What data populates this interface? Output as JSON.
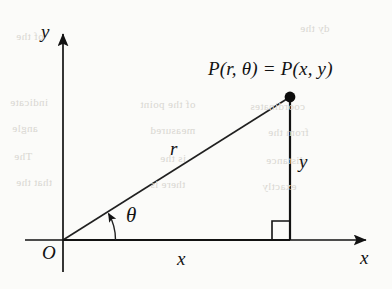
{
  "figure": {
    "background_color": "#fbfbf9",
    "ink_color": "#121212",
    "width": 392,
    "height": 289
  },
  "labels": {
    "point_p": "P(r, θ) = P(x, y)",
    "radius": "r",
    "angle": "θ",
    "vertical_leg": "y",
    "horizontal_leg": "x",
    "axis_y": "y",
    "axis_x": "x",
    "origin": "O"
  },
  "chart_data": {
    "type": "diagram",
    "subtitle": "",
    "xlabel": "x",
    "ylabel": "y",
    "grid": false,
    "legend": "none",
    "annotations": [
      "P(r, θ) = P(x, y)",
      "r",
      "θ",
      "y",
      "x",
      "O"
    ],
    "points": [
      {
        "name": "O",
        "label": "O",
        "px": [
          63,
          240
        ]
      },
      {
        "name": "P",
        "label": "P(r, θ) = P(x, y)",
        "px": [
          290,
          97
        ]
      },
      {
        "name": "foot",
        "label": "",
        "px": [
          290,
          240
        ]
      }
    ],
    "segments": [
      {
        "name": "radius",
        "label": "r",
        "from": [
          63,
          240
        ],
        "to": [
          290,
          97
        ]
      },
      {
        "name": "vertical-leg",
        "label": "y",
        "from": [
          290,
          240
        ],
        "to": [
          290,
          97
        ]
      },
      {
        "name": "horizontal-leg",
        "label": "x",
        "from": [
          63,
          240
        ],
        "to": [
          290,
          240
        ]
      }
    ],
    "axes": [
      {
        "name": "x-axis",
        "from": [
          25,
          240
        ],
        "to": [
          372,
          240
        ],
        "arrow": "end"
      },
      {
        "name": "y-axis",
        "from": [
          63,
          272
        ],
        "to": [
          63,
          28
        ],
        "arrow": "end"
      }
    ],
    "markers": [
      {
        "name": "right-angle",
        "type": "square",
        "at": [
          290,
          240
        ],
        "size": 18
      },
      {
        "name": "angle-arc",
        "type": "arc",
        "at": [
          63,
          240
        ],
        "radius": 52,
        "from_deg": 0,
        "to_deg": 32,
        "arrow": "end"
      }
    ]
  },
  "bleed_text": [
    {
      "text": "of the",
      "left": 16,
      "top": 30
    },
    {
      "text": "dy the",
      "left": 300,
      "top": 22
    },
    {
      "text": "indicate",
      "left": 10,
      "top": 96
    },
    {
      "text": "angle",
      "left": 12,
      "top": 122
    },
    {
      "text": "The",
      "left": 14,
      "top": 150
    },
    {
      "text": "that the",
      "left": 16,
      "top": 176
    },
    {
      "text": "of the point",
      "left": 140,
      "top": 98
    },
    {
      "text": "measured",
      "left": 150,
      "top": 124
    },
    {
      "text": "is the",
      "left": 160,
      "top": 152
    },
    {
      "text": "there is",
      "left": 150,
      "top": 178
    },
    {
      "text": "coordinates",
      "left": 250,
      "top": 100
    },
    {
      "text": "from the",
      "left": 268,
      "top": 126
    },
    {
      "text": "distance",
      "left": 266,
      "top": 154
    },
    {
      "text": "exactly",
      "left": 262,
      "top": 180
    }
  ]
}
